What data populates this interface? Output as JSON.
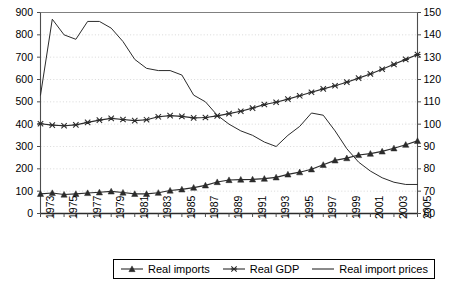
{
  "chart_data": {
    "type": "line",
    "title": "",
    "xlabel": "",
    "ylabel": "",
    "grid": true,
    "legend_position": "bottom",
    "x": [
      1973,
      1974,
      1975,
      1976,
      1977,
      1978,
      1979,
      1980,
      1981,
      1982,
      1983,
      1984,
      1985,
      1986,
      1987,
      1988,
      1989,
      1990,
      1991,
      1992,
      1993,
      1994,
      1995,
      1996,
      1997,
      1998,
      1999,
      2000,
      2001,
      2002,
      2003,
      2004,
      2005
    ],
    "x_tick_labels": [
      "1973",
      "1975",
      "1977",
      "1979",
      "1981",
      "1983",
      "1985",
      "1987",
      "1989",
      "1991",
      "1993",
      "1995",
      "1997",
      "1999",
      "2001",
      "2003",
      "2005"
    ],
    "axes": {
      "left": {
        "label": "",
        "min": 0,
        "max": 900,
        "step": 100,
        "ticks": [
          "0",
          "100",
          "200",
          "300",
          "400",
          "500",
          "600",
          "700",
          "800",
          "900"
        ]
      },
      "right": {
        "label": "",
        "min": 60,
        "max": 150,
        "step": 10,
        "ticks": [
          "60",
          "70",
          "80",
          "90",
          "100",
          "110",
          "120",
          "130",
          "140",
          "150"
        ]
      }
    },
    "series": [
      {
        "name": "Real imports",
        "axis": "left",
        "marker": "triangle",
        "color": "#2b2b2b",
        "values": [
          88,
          92,
          85,
          88,
          92,
          95,
          99,
          94,
          88,
          88,
          93,
          103,
          108,
          116,
          126,
          141,
          150,
          152,
          153,
          156,
          162,
          175,
          185,
          198,
          218,
          238,
          248,
          262,
          268,
          278,
          292,
          308,
          325
        ]
      },
      {
        "name": "Real GDP",
        "axis": "left",
        "marker": "x",
        "color": "#2b2b2b",
        "values": [
          402,
          396,
          393,
          397,
          408,
          418,
          426,
          421,
          416,
          420,
          433,
          438,
          435,
          428,
          430,
          437,
          447,
          458,
          472,
          488,
          498,
          512,
          527,
          543,
          558,
          572,
          588,
          606,
          625,
          646,
          668,
          690,
          712
        ]
      },
      {
        "name": "Real import prices",
        "axis": "right",
        "marker": "none",
        "color": "#2b2b2b",
        "values": [
          113,
          147,
          140,
          138,
          146,
          146,
          143,
          137,
          129,
          125,
          124,
          124,
          122,
          113,
          110,
          104,
          100,
          97,
          95,
          92,
          90,
          95,
          99,
          105,
          104,
          97,
          89,
          83,
          79,
          76,
          74,
          73,
          73
        ]
      }
    ]
  },
  "legend": {
    "items": [
      {
        "label": "Real imports",
        "marker": "triangle-marker-icon"
      },
      {
        "label": "Real GDP",
        "marker": "x-marker-icon"
      },
      {
        "label": "Real import prices",
        "marker": "line-marker-icon"
      }
    ]
  }
}
